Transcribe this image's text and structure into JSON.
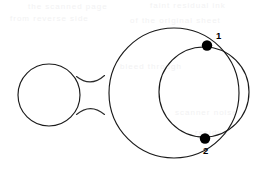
{
  "figure": {
    "background_color": "#ffffff",
    "stroke_color": "#1a1a1a",
    "dot_color": "#000000",
    "width": 270,
    "height": 172,
    "shapes": {
      "small_circle": {
        "name": "small-circle",
        "cx": 49,
        "cy": 95,
        "r": 31
      },
      "large_circle": {
        "name": "large-circle",
        "cx": 174,
        "cy": 93,
        "r": 65
      },
      "right_circle": {
        "name": "right-circle",
        "cx": 204,
        "cy": 92,
        "r": 45
      }
    },
    "neck": {
      "name": "neck-connector",
      "top_path": "M 76.5 76.5 C 86 84 95 84 104.5 75.5",
      "bottom_path": "M 76.5 114.5 C 86 106.5 95 106.5 104.5 114.5"
    },
    "nodes": [
      {
        "id": "1",
        "label": "1",
        "x": 207,
        "y": 45.5,
        "r": 5.2,
        "label_x": 216,
        "label_y": 39
      },
      {
        "id": "2",
        "label": "2",
        "x": 205,
        "y": 138.5,
        "r": 5.2,
        "label_x": 203,
        "label_y": 154
      }
    ],
    "ghost_artifacts": [
      {
        "text": "the scanned page",
        "x": 28,
        "y": 2
      },
      {
        "text": "faint residual ink",
        "x": 150,
        "y": 1
      },
      {
        "text": "from reverse side",
        "x": 10,
        "y": 14
      },
      {
        "text": "of the original sheet",
        "x": 130,
        "y": 16
      },
      {
        "text": "bleed through",
        "x": 120,
        "y": 62
      },
      {
        "text": "scanner noise",
        "x": 175,
        "y": 108
      },
      {
        "text": "residue",
        "x": 195,
        "y": 128
      }
    ]
  }
}
